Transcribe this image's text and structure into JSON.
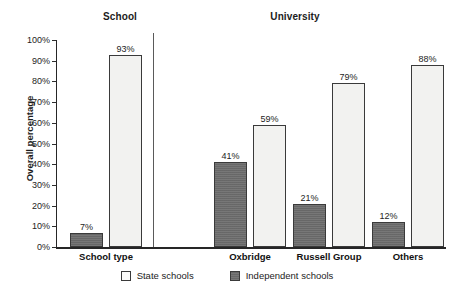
{
  "chart_data": {
    "type": "bar",
    "title": "",
    "xlabel": "",
    "ylabel": "Overall percentage",
    "ylim": [
      0,
      100
    ],
    "grid": false,
    "legend_position": "bottom",
    "y_tick_labels": [
      "0%",
      "10%",
      "20%",
      "30%",
      "40%",
      "50%",
      "60%",
      "70%",
      "80%",
      "90%",
      "100%"
    ],
    "y_ticks": [
      0,
      10,
      20,
      30,
      40,
      50,
      60,
      70,
      80,
      90,
      100
    ],
    "section_headers": [
      "School",
      "University"
    ],
    "categories": [
      "School type",
      "Oxbridge",
      "Russell Group",
      "Others"
    ],
    "series": [
      {
        "name": "Independent schools",
        "color": "#6d6d6d",
        "values": [
          7,
          41,
          21,
          12
        ],
        "value_labels": [
          "7%",
          "41%",
          "21%",
          "12%"
        ]
      },
      {
        "name": "State schools",
        "color": "#f2f2f0",
        "values": [
          93,
          59,
          79,
          88
        ],
        "value_labels": [
          "93%",
          "59%",
          "79%",
          "88%"
        ]
      }
    ],
    "groups": [
      {
        "section": "School",
        "category": "School type",
        "bars": [
          {
            "series": "Independent schools",
            "value": 7,
            "label": "7%"
          },
          {
            "series": "State schools",
            "value": 93,
            "label": "93%"
          }
        ]
      },
      {
        "section": "University",
        "category": "Oxbridge",
        "bars": [
          {
            "series": "Independent schools",
            "value": 41,
            "label": "41%"
          },
          {
            "series": "State schools",
            "value": 59,
            "label": "59%"
          }
        ]
      },
      {
        "section": "University",
        "category": "Russell Group",
        "bars": [
          {
            "series": "Independent schools",
            "value": 21,
            "label": "21%"
          },
          {
            "series": "State schools",
            "value": 79,
            "label": "79%"
          }
        ]
      },
      {
        "section": "University",
        "category": "Others",
        "bars": [
          {
            "series": "Independent schools",
            "value": 12,
            "label": "12%"
          },
          {
            "series": "State schools",
            "value": 88,
            "label": "88%"
          }
        ]
      }
    ],
    "legend": [
      {
        "label": "State schools",
        "swatch": "state"
      },
      {
        "label": "Independent schools",
        "swatch": "independent"
      }
    ]
  },
  "colors": {
    "independent_fill": "#6d6d6d",
    "state_fill": "#f2f2f0",
    "outline": "#3a3a3a",
    "axis": "#262626",
    "text": "#1c1c1c",
    "background": "#ffffff"
  }
}
